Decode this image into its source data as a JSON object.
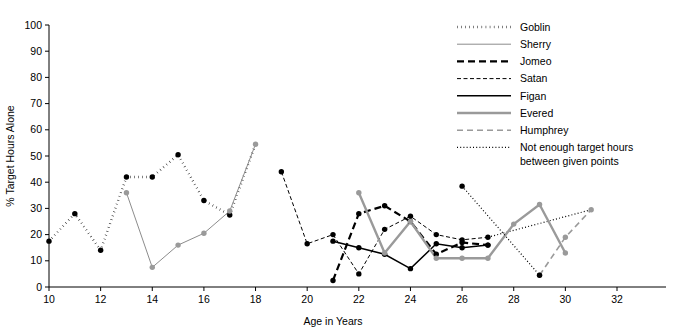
{
  "chart_data": {
    "type": "line",
    "title": "",
    "xlabel": "Age in Years",
    "ylabel": "% Target Hours Alone",
    "xlim": [
      10,
      33
    ],
    "ylim": [
      0,
      100
    ],
    "xticks": [
      10,
      12,
      14,
      16,
      18,
      20,
      22,
      24,
      26,
      28,
      30,
      32
    ],
    "xtick_labels": [
      "10",
      "12",
      "14",
      "16",
      "18",
      "20",
      "22",
      "24",
      "26",
      "28",
      "30",
      "32"
    ],
    "yticks": [
      0,
      10,
      20,
      30,
      40,
      50,
      60,
      70,
      80,
      90,
      100
    ],
    "ytick_labels": [
      "0",
      "10",
      "20",
      "30",
      "40",
      "50",
      "60",
      "70",
      "80",
      "90",
      "100"
    ],
    "grid": false,
    "legend_position": "top-right",
    "series": [
      {
        "name": "Goblin",
        "style": "dotted-thick",
        "color": "#000000",
        "width": 2.4,
        "dash": "0.5,3.6",
        "markers": true,
        "x": [
          10,
          11,
          12,
          13,
          14,
          15,
          16,
          17
        ],
        "values": [
          17.5,
          28,
          14,
          42,
          42,
          50.5,
          33,
          27.5
        ]
      },
      {
        "name": "Sherry",
        "style": "solid-thin-gray",
        "color": "#8c8c8c",
        "width": 1,
        "dash": "",
        "markers": true,
        "x": [
          13,
          14,
          15,
          16,
          17,
          18
        ],
        "values": [
          36,
          7.5,
          16,
          20.5,
          29,
          54.5
        ]
      },
      {
        "name": "Jomeo",
        "style": "dashed-thick",
        "color": "#000000",
        "width": 2.2,
        "dash": "7,4",
        "markers": true,
        "x": [
          21,
          22,
          23,
          24,
          25,
          26,
          27
        ],
        "values": [
          2.5,
          28,
          31,
          25,
          12.5,
          17,
          16
        ]
      },
      {
        "name": "Satan",
        "style": "dashed-thin",
        "color": "#000000",
        "width": 1,
        "dash": "4,2.5",
        "markers": true,
        "x": [
          19,
          20,
          21,
          22,
          23,
          24,
          25,
          26,
          27
        ],
        "values": [
          44,
          16.5,
          20,
          5,
          22,
          27,
          20,
          18,
          19
        ]
      },
      {
        "name": "Figan",
        "style": "solid-thick",
        "color": "#000000",
        "width": 1.5,
        "dash": "",
        "markers": true,
        "x": [
          21,
          22,
          23,
          24,
          25,
          26,
          27
        ],
        "values": [
          17.5,
          15,
          12.5,
          7,
          16.5,
          15,
          16
        ]
      },
      {
        "name": "Evered",
        "style": "solid-thick-gray",
        "color": "#9a9a9a",
        "width": 2.4,
        "dash": "",
        "markers": true,
        "x": [
          22,
          23,
          24,
          25,
          26,
          27,
          28,
          29,
          30
        ],
        "values": [
          36,
          13,
          25,
          11,
          11,
          11,
          24,
          31.5,
          13
        ]
      },
      {
        "name": "Humphrey",
        "style": "dashed-gray",
        "color": "#9a9a9a",
        "width": 1.6,
        "dash": "6,4",
        "markers": true,
        "x": [
          29,
          30,
          31
        ],
        "values": [
          4.5,
          19,
          29.5
        ]
      },
      {
        "name": "Not enough target hours between given points",
        "style": "dotted-fine",
        "color": "#000000",
        "width": 1.2,
        "dash": "1,2.2",
        "markers": true,
        "x": [
          26,
          29
        ],
        "values": [
          38.5,
          4.5
        ]
      }
    ],
    "connector_segments": [
      {
        "name": "goblin-to-sherry-18",
        "style": "dotted-thick",
        "x": [
          17,
          18
        ],
        "values": [
          27.5,
          54.5
        ]
      },
      {
        "name": "satan-gap-27-31",
        "style": "dotted-fine",
        "x": [
          27,
          31
        ],
        "values": [
          19,
          29.5
        ]
      }
    ]
  },
  "legend": {
    "items": [
      {
        "label": "Goblin"
      },
      {
        "label": "Sherry"
      },
      {
        "label": "Jomeo"
      },
      {
        "label": "Satan"
      },
      {
        "label": "Figan"
      },
      {
        "label": "Evered"
      },
      {
        "label": "Humphrey"
      },
      {
        "label": "Not enough target hours"
      },
      {
        "label": "between given points"
      }
    ]
  }
}
